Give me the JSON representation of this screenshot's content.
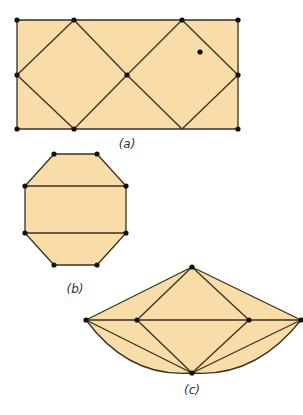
{
  "colors": {
    "fill": "#F9DDA9",
    "stroke": "#3a2f22",
    "vertex": "#111111",
    "caption": "#333333"
  },
  "figures": [
    {
      "id": "a",
      "caption": "(a)",
      "caption_pos": [
        127,
        148
      ],
      "shape": "rectangle",
      "outline": [
        [
          17,
          20
        ],
        [
          238,
          20
        ],
        [
          238,
          129
        ],
        [
          17,
          129
        ]
      ],
      "edges": [
        [
          [
            17,
            75
          ],
          [
            74,
            20
          ]
        ],
        [
          [
            74,
            20
          ],
          [
            127,
            75
          ]
        ],
        [
          [
            127,
            75
          ],
          [
            74,
            129
          ]
        ],
        [
          [
            74,
            129
          ],
          [
            17,
            75
          ]
        ],
        [
          [
            127,
            75
          ],
          [
            182,
            20
          ]
        ],
        [
          [
            182,
            20
          ],
          [
            238,
            75
          ]
        ],
        [
          [
            238,
            75
          ],
          [
            182,
            129
          ]
        ],
        [
          [
            182,
            129
          ],
          [
            127,
            75
          ]
        ]
      ],
      "vertices": [
        [
          17,
          20
        ],
        [
          74,
          20
        ],
        [
          182,
          20
        ],
        [
          238,
          20
        ],
        [
          17,
          75
        ],
        [
          127,
          75
        ],
        [
          238,
          75
        ],
        [
          17,
          129
        ],
        [
          74,
          129
        ],
        [
          238,
          129
        ]
      ],
      "interior_points": [
        [
          200,
          52
        ]
      ]
    },
    {
      "id": "b",
      "caption": "(b)",
      "caption_pos": [
        75,
        293
      ],
      "shape": "octagon",
      "outline": [
        [
          54,
          154
        ],
        [
          97,
          154
        ],
        [
          126,
          186
        ],
        [
          126,
          233
        ],
        [
          97,
          265
        ],
        [
          54,
          265
        ],
        [
          25,
          233
        ],
        [
          25,
          186
        ]
      ],
      "edges": [
        [
          [
            25,
            186
          ],
          [
            126,
            186
          ]
        ],
        [
          [
            25,
            233
          ],
          [
            126,
            233
          ]
        ]
      ],
      "vertices": [
        [
          54,
          154
        ],
        [
          97,
          154
        ],
        [
          25,
          186
        ],
        [
          126,
          186
        ],
        [
          25,
          233
        ],
        [
          126,
          233
        ],
        [
          54,
          265
        ],
        [
          97,
          265
        ]
      ],
      "interior_points": []
    },
    {
      "id": "c",
      "caption": "(c)",
      "caption_pos": [
        192,
        394
      ],
      "shape": "kite-with-arc",
      "outline_path": "M86,320 L192,267 L301,320 Q255,378 192,373 Q129,378 86,320 Z",
      "edges": [
        [
          [
            86,
            320
          ],
          [
            301,
            320
          ]
        ],
        [
          [
            192,
            267
          ],
          [
            137,
            320
          ]
        ],
        [
          [
            192,
            267
          ],
          [
            249,
            320
          ]
        ],
        [
          [
            137,
            320
          ],
          [
            192,
            373
          ]
        ],
        [
          [
            249,
            320
          ],
          [
            192,
            373
          ]
        ],
        [
          [
            86,
            320
          ],
          [
            192,
            373
          ]
        ],
        [
          [
            301,
            320
          ],
          [
            192,
            373
          ]
        ]
      ],
      "vertices": [
        [
          192,
          267
        ],
        [
          86,
          320
        ],
        [
          137,
          320
        ],
        [
          249,
          320
        ],
        [
          301,
          320
        ],
        [
          192,
          373
        ]
      ],
      "interior_points": []
    }
  ]
}
